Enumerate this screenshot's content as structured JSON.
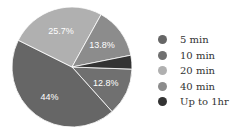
{
  "chart_data": {
    "type": "pie",
    "title": "",
    "categories": [
      "5 min",
      "10 min",
      "20 min",
      "40 min",
      "Up to 1hr"
    ],
    "values": [
      44,
      12.8,
      25.7,
      13.8,
      3.7
    ],
    "labels": [
      "44%",
      "12.8%",
      "25.7%",
      "13.8%",
      ""
    ],
    "colors": [
      "#666666",
      "#707070",
      "#b0b0b0",
      "#8c8c8c",
      "#333333"
    ],
    "legend_position": "right"
  },
  "legend": {
    "items": [
      {
        "label": "5 min",
        "color": "#666666"
      },
      {
        "label": "10 min",
        "color": "#707070"
      },
      {
        "label": "20 min",
        "color": "#b0b0b0"
      },
      {
        "label": "40 min",
        "color": "#8c8c8c"
      },
      {
        "label": "Up to 1hr",
        "color": "#333333"
      }
    ]
  }
}
